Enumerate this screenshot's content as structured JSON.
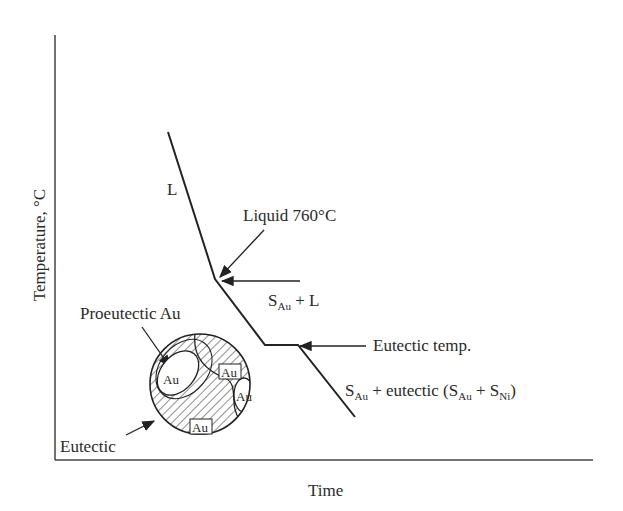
{
  "axes": {
    "x_label": "Time",
    "y_label": "Temperature, °C"
  },
  "curve_labels": {
    "liquid_region": "L",
    "liquidus": "Liquid 760°C",
    "solid_plus_liquid": {
      "S": "S",
      "sub": "Au",
      "rest": " + L"
    },
    "eutectic_temp": "Eutectic temp.",
    "final": {
      "s1": "S",
      "sub1": "Au",
      "mid": " + eutectic (S",
      "sub2": "Au",
      "mid2": " + S",
      "sub3": "Ni",
      "end": ")"
    }
  },
  "microstructure": {
    "proeutectic_label": "Proeutectic Au",
    "eutectic_label": "Eutectic",
    "grain_labels": [
      "Au",
      "Au",
      "Au",
      "Au"
    ]
  },
  "colors": {
    "line": "#222222",
    "background": "#ffffff"
  }
}
